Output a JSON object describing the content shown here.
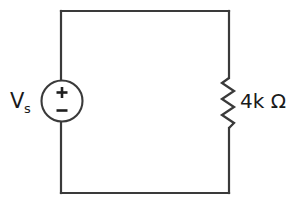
{
  "diagram": {
    "background_color": "#ffffff",
    "line_color": "#3a3a3a",
    "text_color": "#1a1a1a"
  },
  "source": {
    "name": "voltage-source",
    "label_main": "V",
    "label_sub": "s",
    "polarity_positive": "+",
    "polarity_negative": "−",
    "symbol": "circle"
  },
  "resistor": {
    "name": "resistor",
    "label": "4k Ω",
    "value": "4k",
    "unit": "Ω",
    "symbol": "zigzag"
  },
  "wires": {
    "top": "top-wire",
    "bottom": "bottom-wire",
    "left": "left-wire",
    "right": "right-wire"
  }
}
